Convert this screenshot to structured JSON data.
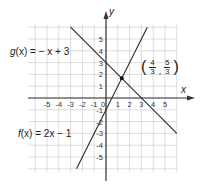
{
  "chart_data": {
    "type": "line",
    "title": "",
    "xlabel": "x",
    "ylabel": "y",
    "xlim": [
      -6.5,
      6
    ],
    "ylim": [
      -6.2,
      6.2
    ],
    "grid": true,
    "x_ticks": [
      -5,
      -4,
      -3,
      -2,
      -1,
      0,
      1,
      2,
      3,
      4,
      5
    ],
    "y_ticks": [
      -5,
      -4,
      -3,
      -2,
      -1,
      1,
      2,
      3,
      4,
      5
    ],
    "x_tick_labels": [
      "-5",
      "-4",
      "-3",
      "-2",
      "-1",
      "0",
      "1",
      "2",
      "3",
      "4",
      "5"
    ],
    "y_tick_labels": [
      "-5",
      "-4",
      "-3",
      "-2",
      "-1",
      "1",
      "2",
      "3",
      "4",
      "5"
    ],
    "series": [
      {
        "name": "f(x) = 2x − 1",
        "slope": 2,
        "intercept": -1,
        "x": [
          -2.5,
          3.5
        ],
        "y": [
          -6,
          6
        ]
      },
      {
        "name": "g(x) = −x + 3",
        "slope": -1,
        "intercept": 3,
        "x": [
          -3,
          6
        ],
        "y": [
          6,
          -3
        ]
      }
    ],
    "annotations": [
      {
        "text": "(4/3, 5/3)",
        "x": 1.3333,
        "y": 1.6667,
        "type": "intersection-point"
      }
    ]
  },
  "labels": {
    "g_func": "g",
    "g_arg": "(x)",
    "g_eq": " = − x + 3",
    "f_func": "f",
    "f_arg": "(x)",
    "f_eq": " = 2x − 1",
    "point_open": "(",
    "point_x_num": "4",
    "point_x_den": "3",
    "point_sep": ",",
    "point_y_num": "5",
    "point_y_den": "3",
    "point_close": ")",
    "x_axis": "x",
    "y_axis": "y"
  },
  "colors": {
    "grid": "#cfcfcf",
    "axis": "#333333",
    "line": "#2a2a2a",
    "point": "#111111"
  }
}
